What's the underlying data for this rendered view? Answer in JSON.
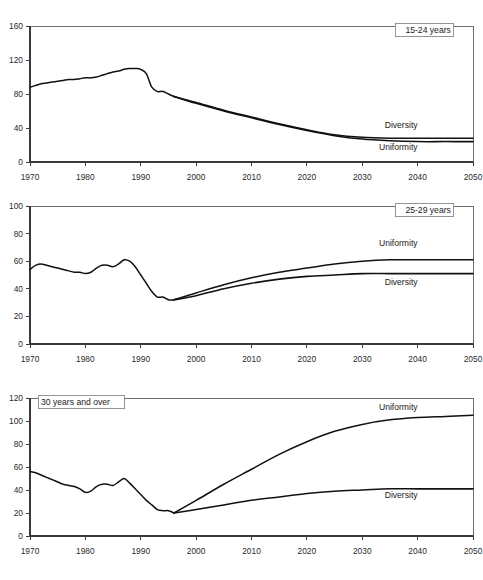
{
  "figure": {
    "faint_top_text": "",
    "background": "#ffffff",
    "line_color": "#111111",
    "axis_color": "#3a3a3a",
    "frame_color": "#6e6e72"
  },
  "chart_data": [
    {
      "type": "line",
      "title": "15-24 years",
      "panel_label": "15-24 years",
      "xlabel": "",
      "ylabel": "",
      "xlim": [
        1970,
        2050
      ],
      "ylim": [
        0,
        160
      ],
      "ytick_step": 40,
      "xticks": [
        1970,
        1980,
        1990,
        2000,
        2010,
        2020,
        2030,
        2040,
        2050
      ],
      "yticks": [
        0,
        40,
        80,
        120,
        160
      ],
      "grid": false,
      "legend_position": "inline-right",
      "annotations": [
        {
          "text": "15-24 years",
          "x": 2046,
          "y": 152,
          "role": "panel-label"
        },
        {
          "text": "Diversity",
          "x": 2040,
          "y": 40,
          "role": "series-label"
        },
        {
          "text": "Uniformity",
          "x": 2040,
          "y": 14,
          "role": "series-label"
        }
      ],
      "series": [
        {
          "name": "Historical",
          "x": [
            1970,
            1971,
            1972,
            1973,
            1974,
            1975,
            1976,
            1977,
            1978,
            1979,
            1980,
            1981,
            1982,
            1983,
            1984,
            1985,
            1986,
            1987,
            1988,
            1989,
            1990,
            1991,
            1992,
            1993,
            1994,
            1995,
            1996
          ],
          "values": [
            88,
            90,
            92,
            93,
            94,
            95,
            96,
            97,
            97,
            98,
            99,
            99,
            100,
            102,
            104,
            106,
            107,
            109,
            110,
            110,
            109,
            104,
            88,
            83,
            83,
            80,
            77
          ]
        },
        {
          "name": "Diversity",
          "x": [
            1996,
            2000,
            2005,
            2010,
            2015,
            2020,
            2025,
            2030,
            2035,
            2040,
            2045,
            2050
          ],
          "values": [
            77,
            70,
            61,
            53,
            45,
            38,
            32,
            29,
            28,
            28,
            28,
            28
          ]
        },
        {
          "name": "Uniformity",
          "x": [
            1996,
            2000,
            2005,
            2010,
            2015,
            2020,
            2025,
            2030,
            2035,
            2040,
            2045,
            2050
          ],
          "values": [
            77,
            69,
            60,
            52,
            44,
            37,
            31,
            27,
            25,
            24,
            24,
            24
          ]
        }
      ]
    },
    {
      "type": "line",
      "title": "25-29 years",
      "panel_label": "25-29 years",
      "xlabel": "",
      "ylabel": "",
      "xlim": [
        1970,
        2050
      ],
      "ylim": [
        0,
        100
      ],
      "ytick_step": 20,
      "xticks": [
        1970,
        1980,
        1990,
        2000,
        2010,
        2020,
        2030,
        2040,
        2050
      ],
      "yticks": [
        0,
        20,
        40,
        60,
        80,
        100
      ],
      "grid": false,
      "legend_position": "inline-right",
      "annotations": [
        {
          "text": "25-29 years",
          "x": 2046,
          "y": 95,
          "role": "panel-label"
        },
        {
          "text": "Uniformity",
          "x": 2040,
          "y": 71,
          "role": "series-label"
        },
        {
          "text": "Diversity",
          "x": 2040,
          "y": 43,
          "role": "series-label"
        }
      ],
      "series": [
        {
          "name": "Historical",
          "x": [
            1970,
            1971,
            1972,
            1973,
            1974,
            1975,
            1976,
            1977,
            1978,
            1979,
            1980,
            1981,
            1982,
            1983,
            1984,
            1985,
            1986,
            1987,
            1988,
            1989,
            1990,
            1991,
            1992,
            1993,
            1994,
            1995,
            1996
          ],
          "values": [
            54,
            57,
            58,
            57,
            56,
            55,
            54,
            53,
            52,
            52,
            51,
            52,
            55,
            57,
            57,
            56,
            58,
            61,
            60,
            56,
            50,
            44,
            38,
            34,
            34,
            32,
            32
          ]
        },
        {
          "name": "Uniformity",
          "x": [
            1996,
            2000,
            2005,
            2010,
            2015,
            2020,
            2025,
            2030,
            2035,
            2040,
            2045,
            2050
          ],
          "values": [
            32,
            37,
            43,
            48,
            52,
            55,
            58,
            60,
            61,
            61,
            61,
            61
          ]
        },
        {
          "name": "Diversity",
          "x": [
            1996,
            2000,
            2005,
            2010,
            2015,
            2020,
            2025,
            2030,
            2035,
            2040,
            2045,
            2050
          ],
          "values": [
            32,
            35,
            40,
            44,
            47,
            49,
            50,
            51,
            51,
            51,
            51,
            51
          ]
        }
      ]
    },
    {
      "type": "line",
      "title": "30 years and over",
      "panel_label": "30 years and over",
      "xlabel": "",
      "ylabel": "",
      "xlim": [
        1970,
        2050
      ],
      "ylim": [
        0,
        120
      ],
      "ytick_step": 20,
      "xticks": [
        1970,
        1980,
        1990,
        2000,
        2010,
        2020,
        2030,
        2040,
        2050
      ],
      "yticks": [
        0,
        20,
        40,
        60,
        80,
        100,
        120
      ],
      "grid": false,
      "legend_position": "inline-right",
      "annotations": [
        {
          "text": "30 years and over",
          "x": 1972,
          "y": 114,
          "role": "panel-label"
        },
        {
          "text": "Uniformity",
          "x": 2040,
          "y": 110,
          "role": "series-label"
        },
        {
          "text": "Diversity",
          "x": 2040,
          "y": 33,
          "role": "series-label"
        }
      ],
      "series": [
        {
          "name": "Historical",
          "x": [
            1970,
            1971,
            1972,
            1973,
            1974,
            1975,
            1976,
            1977,
            1978,
            1979,
            1980,
            1981,
            1982,
            1983,
            1984,
            1985,
            1986,
            1987,
            1988,
            1989,
            1990,
            1991,
            1992,
            1993,
            1994,
            1995,
            1996
          ],
          "values": [
            56,
            55,
            53,
            51,
            49,
            47,
            45,
            44,
            43,
            41,
            38,
            39,
            43,
            45,
            45,
            44,
            47,
            50,
            46,
            41,
            36,
            31,
            27,
            23,
            22,
            22,
            20
          ]
        },
        {
          "name": "Uniformity",
          "x": [
            1996,
            2000,
            2005,
            2010,
            2015,
            2020,
            2025,
            2030,
            2035,
            2040,
            2045,
            2050
          ],
          "values": [
            20,
            31,
            45,
            58,
            71,
            82,
            91,
            97,
            101,
            103,
            104,
            105
          ]
        },
        {
          "name": "Diversity",
          "x": [
            1996,
            2000,
            2005,
            2010,
            2015,
            2020,
            2025,
            2030,
            2035,
            2040,
            2045,
            2050
          ],
          "values": [
            20,
            23,
            27,
            31,
            34,
            37,
            39,
            40,
            41,
            41,
            41,
            41
          ]
        }
      ]
    }
  ]
}
